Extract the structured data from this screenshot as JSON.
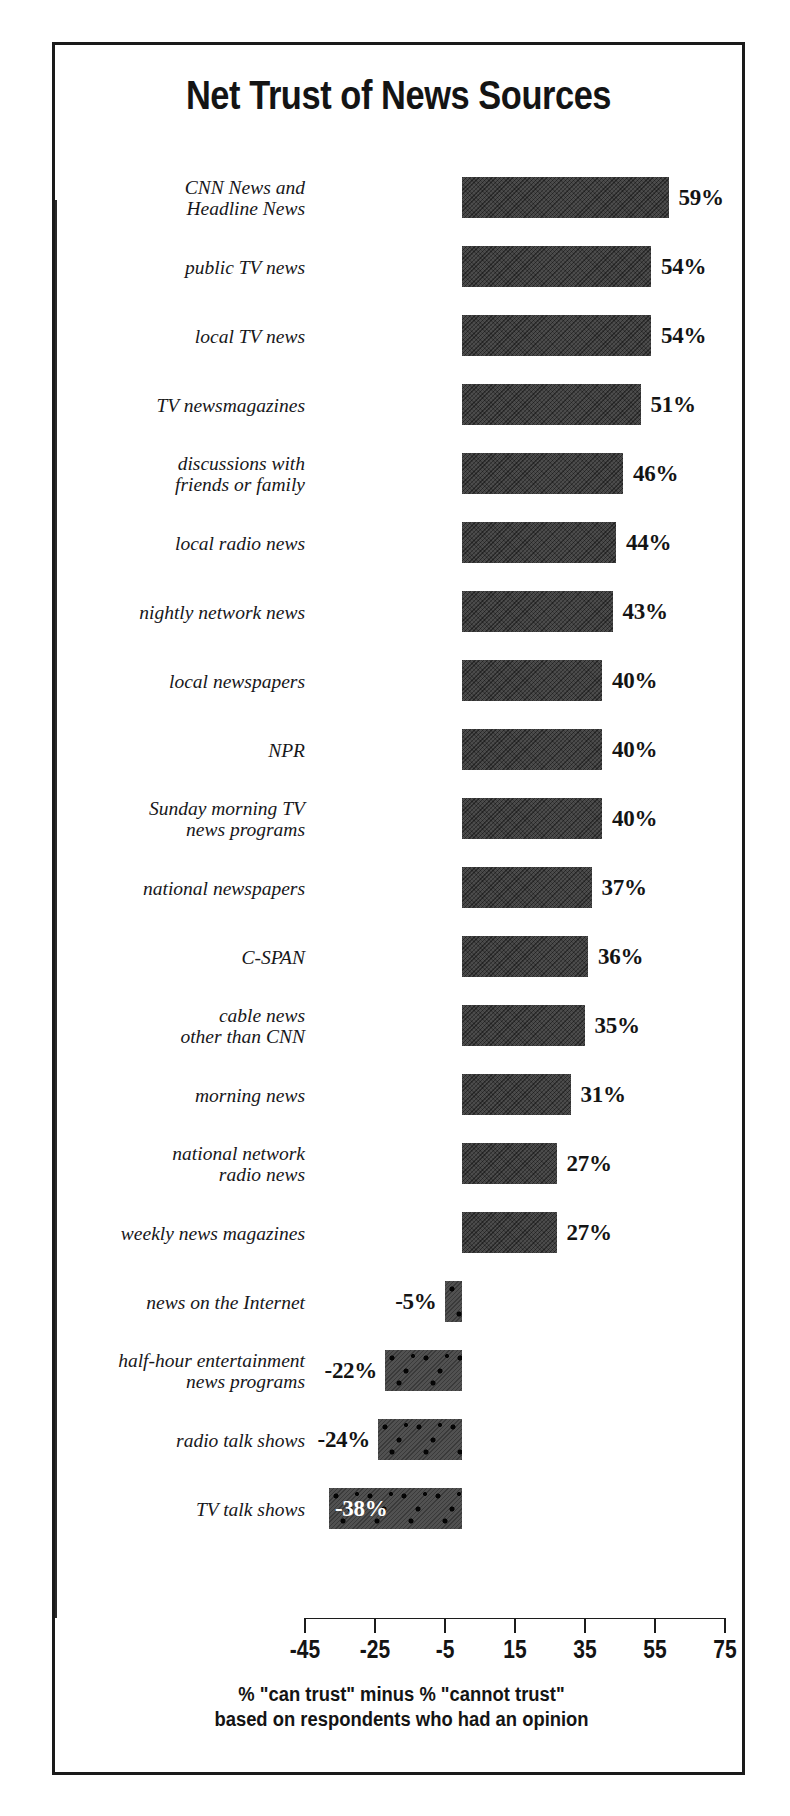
{
  "chart_data": {
    "type": "bar",
    "orientation": "horizontal",
    "title": "Net Trust of News Sources",
    "xlabel": "% \"can trust\" minus % \"cannot trust\"",
    "ylabel": "",
    "xlim": [
      -45,
      75
    ],
    "xticks": [
      "-45",
      "-25",
      "-5",
      "15",
      "35",
      "55",
      "75"
    ],
    "xtick_values": [
      -45,
      -25,
      -5,
      15,
      35,
      55,
      75
    ],
    "grid": false,
    "legend": null,
    "footnote_line1": "% \"can trust\" minus % \"cannot trust\"",
    "footnote_line2": "based on respondents who had an opinion",
    "categories": [
      "CNN News and\nHeadline News",
      "public TV news",
      "local TV news",
      "TV newsmagazines",
      "discussions with\nfriends or family",
      "local radio news",
      "nightly network news",
      "local newspapers",
      "NPR",
      "Sunday morning TV\nnews programs",
      "national newspapers",
      "C-SPAN",
      "cable news\nother than CNN",
      "morning news",
      "national network\nradio news",
      "weekly news magazines",
      "news on the Internet",
      "half-hour entertainment\nnews programs",
      "radio talk shows",
      "TV talk shows"
    ],
    "values": [
      59,
      54,
      54,
      51,
      46,
      44,
      43,
      40,
      40,
      40,
      37,
      36,
      35,
      31,
      27,
      27,
      -5,
      -22,
      -24,
      -38
    ],
    "value_labels": [
      "59%",
      "54%",
      "54%",
      "51%",
      "46%",
      "44%",
      "43%",
      "40%",
      "40%",
      "40%",
      "37%",
      "36%",
      "35%",
      "31%",
      "27%",
      "27%",
      "-5%",
      "-22%",
      "-24%",
      "-38%"
    ],
    "colors": {
      "positive_bar": "#3c3c3c",
      "negative_bar": "#4a4a4a",
      "text": "#141414",
      "inside_label": "#ffffff",
      "frame": "#1a1a1a",
      "background": "#ffffff"
    }
  }
}
